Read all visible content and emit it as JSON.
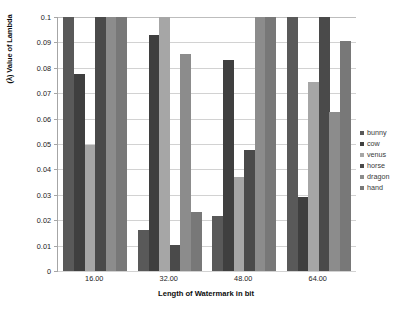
{
  "chart_data": {
    "type": "bar",
    "title": "",
    "xlabel": "Length of Watermark in bit",
    "ylabel": "(λ) Value of Lambda",
    "categories": [
      "16.00",
      "32.00",
      "48.00",
      "64.00"
    ],
    "ylim": [
      0,
      0.1
    ],
    "ytick_labels": [
      "0",
      "0.01",
      "0.02",
      "0.03",
      "0.04",
      "0.05",
      "0.06",
      "0.07",
      "0.08",
      "0.09",
      "0.1"
    ],
    "ytick_values": [
      0,
      0.01,
      0.02,
      0.03,
      0.04,
      0.05,
      0.06,
      0.07,
      0.08,
      0.09,
      0.1
    ],
    "grid": true,
    "legend_position": "right",
    "series": [
      {
        "name": "bunny",
        "color": "#595959",
        "values": [
          0.1,
          0.0162,
          0.0215,
          0.1
        ]
      },
      {
        "name": "cow",
        "color": "#3f3f3f",
        "values": [
          0.0775,
          0.0931,
          0.0829,
          0.0292
        ]
      },
      {
        "name": "venus",
        "color": "#a6a6a6",
        "values": [
          0.0497,
          0.1,
          0.0371,
          0.0744
        ]
      },
      {
        "name": "horse",
        "color": "#4a4a4a",
        "values": [
          0.1,
          0.0101,
          0.0476,
          0.1
        ]
      },
      {
        "name": "dragon",
        "color": "#8c8c8c",
        "values": [
          0.1,
          0.0853,
          0.1,
          0.0626
        ]
      },
      {
        "name": "hand",
        "color": "#787878",
        "values": [
          0.1,
          0.0231,
          0.1,
          0.0905
        ]
      }
    ]
  },
  "axes": {
    "y_title": "(λ) Value of Lambda",
    "x_title": "Length of Watermark in bit"
  },
  "legend": {
    "items": [
      {
        "label": "bunny"
      },
      {
        "label": "cow"
      },
      {
        "label": "venus"
      },
      {
        "label": "horse"
      },
      {
        "label": "dragon"
      },
      {
        "label": "hand"
      }
    ]
  },
  "colors": {
    "background": "#ffffff",
    "gridline": "#d2d2d2",
    "axis": "#a6a6a6",
    "text": "#1a1a1a"
  }
}
